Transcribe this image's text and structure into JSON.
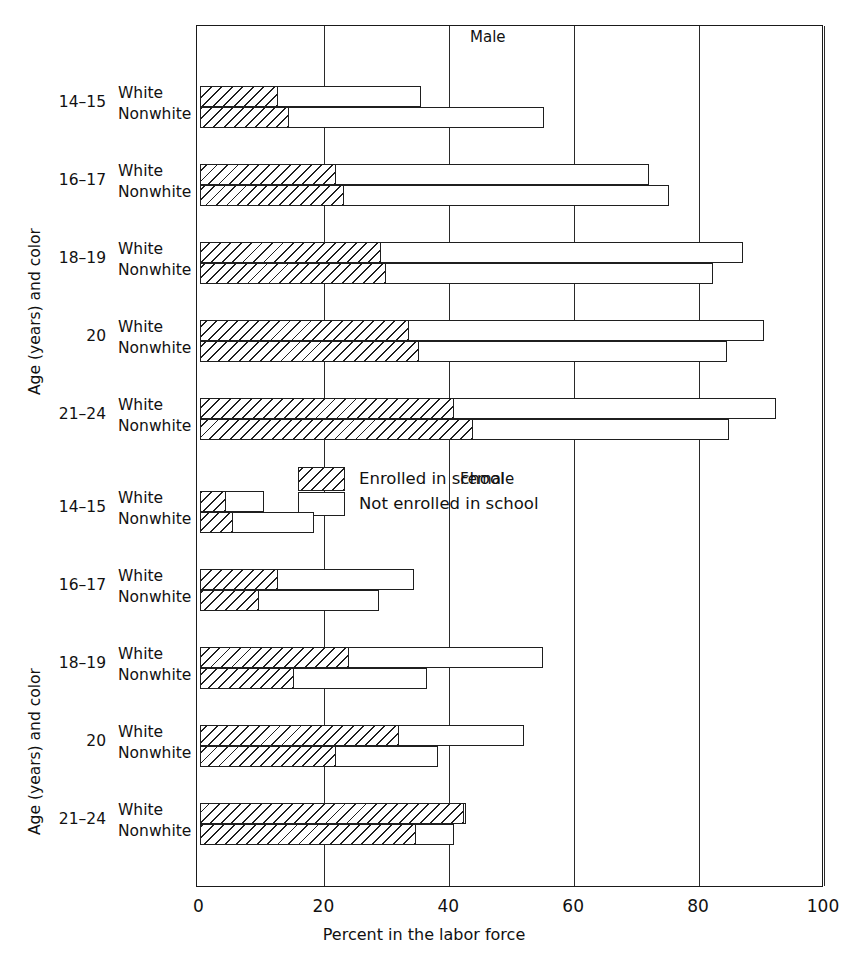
{
  "axis": {
    "y_title": "Age (years) and color",
    "x_title": "Percent in the labor force",
    "x_ticks": [
      "0",
      "20",
      "40",
      "60",
      "80",
      "100"
    ]
  },
  "panels": [
    {
      "title": "Male"
    },
    {
      "title": "Female"
    }
  ],
  "legend": {
    "items": [
      {
        "label": "Enrolled in school",
        "pattern": "hatched"
      },
      {
        "label": "Not enrolled in school",
        "pattern": "open"
      }
    ]
  },
  "groups": [
    "14–15",
    "16–17",
    "18–19",
    "20",
    "21–24"
  ],
  "colors": [
    "White",
    "Nonwhite"
  ],
  "chart_data": {
    "type": "bar",
    "orientation": "horizontal",
    "title": "",
    "xlabel": "Percent in the labor force",
    "ylabel": "Age (years) and color",
    "xlim": [
      0,
      100
    ],
    "xticks": [
      0,
      20,
      40,
      60,
      80,
      100
    ],
    "grid": "vertical gridlines at each x tick",
    "legend_position": "upper-right of lower (Female) panel",
    "stacking": "each bar = enrolled segment (hatched) then not-enrolled segment (open); total = full bar length",
    "series": [
      {
        "name": "Enrolled in school",
        "pattern": "hatched"
      },
      {
        "name": "Not enrolled in school",
        "pattern": "open"
      }
    ],
    "panels": [
      {
        "name": "Male",
        "categories": [
          "14-15 White",
          "14-15 Nonwhite",
          "16-17 White",
          "16-17 Nonwhite",
          "18-19 White",
          "18-19 Nonwhite",
          "20 White",
          "20 Nonwhite",
          "21-24 White",
          "21-24 Nonwhite"
        ],
        "enrolled": [
          12.6,
          14.4,
          21.9,
          23.2,
          29.1,
          29.9,
          33.6,
          35.2,
          40.8,
          43.8
        ],
        "total": [
          35.5,
          55.2,
          72.0,
          75.2,
          87.0,
          82.2,
          90.4,
          84.5,
          92.3,
          84.8
        ]
      },
      {
        "name": "Female",
        "categories": [
          "14-15 White",
          "14-15 Nonwhite",
          "16-17 White",
          "16-17 Nonwhite",
          "18-19 White",
          "18-19 Nonwhite",
          "20 White",
          "20 Nonwhite",
          "21-24 White",
          "21-24 Nonwhite"
        ],
        "enrolled": [
          4.2,
          5.4,
          12.6,
          9.6,
          23.9,
          15.2,
          32.0,
          21.9,
          42.4,
          34.6
        ],
        "total": [
          10.4,
          18.4,
          34.4,
          28.8,
          55.0,
          36.4,
          51.9,
          38.2,
          42.7,
          40.8
        ]
      }
    ]
  }
}
